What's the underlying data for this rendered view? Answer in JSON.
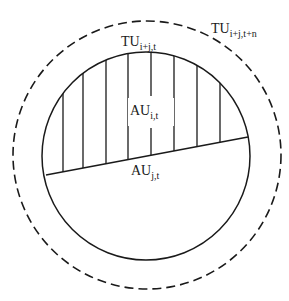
{
  "diagram": {
    "outer_circle": {
      "label_main": "TU",
      "label_sub": "i+j,t+n",
      "style": "dashed"
    },
    "inner_circle": {
      "label_main": "TU",
      "label_sub": "i+j,t",
      "style": "solid"
    },
    "upper_segment": {
      "label_main": "AU",
      "label_sub": "i,t",
      "fill": "vertical-hatching"
    },
    "lower_segment": {
      "label_main": "AU",
      "label_sub": "j,t",
      "fill": "none"
    },
    "colors": {
      "stroke": "#1a1a1a",
      "background": "#ffffff"
    }
  }
}
